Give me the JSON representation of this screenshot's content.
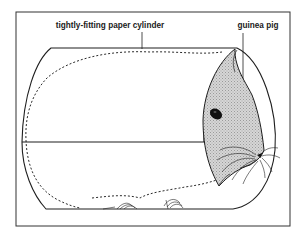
{
  "figure": {
    "labels": {
      "cylinder": "tightly-fitting paper cylinder",
      "animal": "guinea pig"
    },
    "colors": {
      "line": "#1e1e1e",
      "head_shading": "#c8c8c8",
      "background": "#ffffff"
    }
  }
}
